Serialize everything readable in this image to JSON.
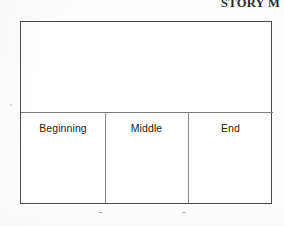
{
  "document": {
    "title": "STORY M",
    "title_note": "clipped at top edge of scan"
  },
  "chart_data": {
    "type": "table",
    "title": "STORY M",
    "categories": [
      "Beginning",
      "Middle",
      "End"
    ],
    "values": [
      "",
      "",
      ""
    ],
    "xlabel": "",
    "ylabel": "",
    "grid": true,
    "legend": "none",
    "layout": {
      "frame": "single bordered rectangle",
      "horizontal_divider": true,
      "vertical_dividers": 2,
      "sections": 3,
      "upper_region": "blank open area above label band",
      "lower_region": "three blank columns below label band"
    }
  },
  "diagram": {
    "sections": [
      {
        "label": "Beginning",
        "content": ""
      },
      {
        "label": "Middle",
        "content": ""
      },
      {
        "label": "End",
        "content": ""
      }
    ]
  },
  "annotations": {
    "axis_left_mark": "≡",
    "tick_bottom_1": "▬",
    "tick_bottom_2": "▬"
  },
  "colors": {
    "page_background": "#fdfdfd",
    "frame_background": "#ffffff",
    "frame_border": "#4a4a4a",
    "divider": "#7d7d7d",
    "text": "#1d1d1d",
    "title_text": "#2a2a2a",
    "faint_mark": "#9a9a9a"
  }
}
